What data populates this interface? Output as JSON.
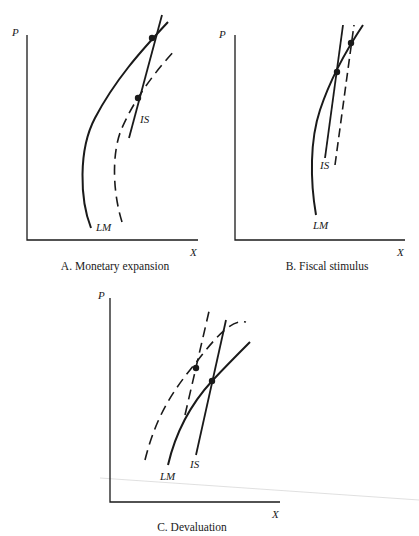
{
  "panels": [
    {
      "id": "A",
      "caption": "A.  Monetary expansion",
      "y_axis_label": "P",
      "x_axis_label": "X",
      "curve_labels": {
        "lm": "LM",
        "is": "IS"
      },
      "description": "LM shifts right (dashed); equilibrium moves down along IS"
    },
    {
      "id": "B",
      "caption": "B.  Fiscal stimulus",
      "y_axis_label": "P",
      "x_axis_label": "X",
      "curve_labels": {
        "lm": "LM",
        "is": "IS"
      },
      "description": "IS shifts right (dashed); equilibrium moves up along LM"
    },
    {
      "id": "C",
      "caption": "C.  Devaluation",
      "y_axis_label": "P",
      "x_axis_label": "X",
      "curve_labels": {
        "lm": "LM",
        "is": "IS"
      },
      "description": "Both LM and IS shift (dashed); new equilibrium up and to the left"
    }
  ],
  "style": {
    "ink": "#1a1a1a",
    "background": "#ffffff"
  }
}
